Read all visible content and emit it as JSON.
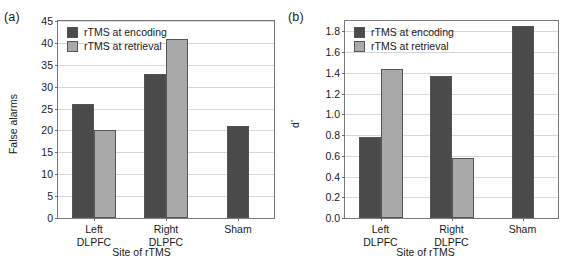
{
  "figure": {
    "panels": [
      {
        "panel_label": "(a)",
        "chart_data": {
          "type": "bar",
          "title": "",
          "categories": [
            "Left DLPFC",
            "Right DLPFC",
            "Sham"
          ],
          "category_lines": [
            [
              "Left",
              "DLPFC"
            ],
            [
              "Right",
              "DLPFC"
            ],
            [
              "Sham"
            ]
          ],
          "series": [
            {
              "name": "rTMS at encoding",
              "values": [
                26,
                33,
                21
              ],
              "color": "#4a4a4a"
            },
            {
              "name": "rTMS at retrieval",
              "values": [
                20,
                41,
                null
              ],
              "color": "#a9a9a9"
            }
          ],
          "xlabel": "Site of rTMS",
          "ylabel": "False alarms",
          "ylim": [
            0,
            45
          ],
          "yticks": [
            0,
            5,
            10,
            15,
            20,
            25,
            30,
            35,
            40,
            45
          ],
          "ytick_labels": [
            "0",
            "5",
            "10",
            "15",
            "20",
            "25",
            "30",
            "35",
            "40",
            "45"
          ],
          "grid": true,
          "legend_position": "top-left"
        }
      },
      {
        "panel_label": "(b)",
        "chart_data": {
          "type": "bar",
          "title": "",
          "categories": [
            "Left DLPFC",
            "Right DLPFC",
            "Sham"
          ],
          "category_lines": [
            [
              "Left",
              "DLPFC"
            ],
            [
              "Right",
              "DLPFC"
            ],
            [
              "Sham"
            ]
          ],
          "series": [
            {
              "name": "rTMS at encoding",
              "values": [
                0.78,
                1.37,
                1.85
              ],
              "color": "#4a4a4a"
            },
            {
              "name": "rTMS at retrieval",
              "values": [
                1.44,
                0.58,
                null
              ],
              "color": "#a9a9a9"
            }
          ],
          "xlabel": "Site of rTMS",
          "ylabel": "d'",
          "ylim": [
            0,
            1.9
          ],
          "yticks": [
            0.0,
            0.2,
            0.4,
            0.6,
            0.8,
            1.0,
            1.2,
            1.4,
            1.6,
            1.8
          ],
          "ytick_labels": [
            "0.0",
            "0.2",
            "0.4",
            "0.6",
            "0.8",
            "1.0",
            "1.2",
            "1.4",
            "1.6",
            "1.8"
          ],
          "grid": true,
          "legend_position": "top-left"
        }
      }
    ]
  }
}
